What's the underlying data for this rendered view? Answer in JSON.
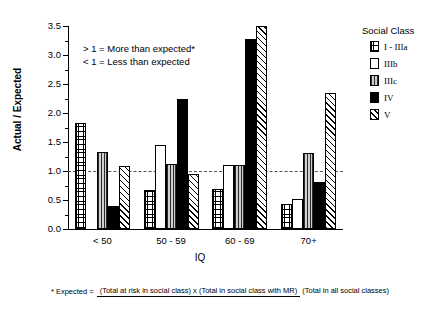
{
  "chart_data": {
    "type": "bar",
    "title": "",
    "xlabel": "IQ",
    "ylabel": "Actual / Expected",
    "categories": [
      "< 50",
      "50 - 59",
      "60 - 69",
      "70+"
    ],
    "series": [
      {
        "name": "I - IIIa",
        "pattern": "grid",
        "values": [
          1.83,
          0.68,
          0.69,
          0.43
        ]
      },
      {
        "name": "IIIb",
        "pattern": "white",
        "values": [
          0.0,
          1.45,
          1.11,
          0.52
        ]
      },
      {
        "name": "IIIc",
        "pattern": "vertical-stripe",
        "values": [
          1.32,
          1.12,
          1.1,
          1.31
        ]
      },
      {
        "name": "IV",
        "pattern": "solid-black",
        "values": [
          0.4,
          2.24,
          3.28,
          0.81
        ]
      },
      {
        "name": "V",
        "pattern": "diagonal-hatch",
        "values": [
          1.08,
          0.95,
          3.5,
          2.35
        ]
      }
    ],
    "ylim": [
      0,
      3.5
    ],
    "ytick_labels": [
      "0.0",
      "0.5",
      "1.0",
      "1.5",
      "2.0",
      "2.5",
      "3.0",
      "3.5"
    ],
    "ytick_values": [
      0,
      0.5,
      1.0,
      1.5,
      2.0,
      2.5,
      3.0,
      3.5
    ],
    "reference_line": {
      "value": 1.0,
      "style": "dashed"
    },
    "grid": false,
    "legend_position": "right"
  },
  "legend": {
    "title": "Social Class",
    "items": [
      {
        "label": "I - IIIa"
      },
      {
        "label": "IIIb"
      },
      {
        "label": "IIIc"
      },
      {
        "label": "IV"
      },
      {
        "label": "V"
      }
    ]
  },
  "annotation": {
    "line1": "> 1 = More than expected*",
    "line2": "< 1 = Less than expected"
  },
  "footnote": {
    "lead": "* Expected =",
    "numerator": "(Total at risk in social class) x (Total in social class with MR)",
    "denominator": "(Total in all social classes)"
  }
}
